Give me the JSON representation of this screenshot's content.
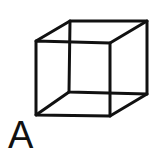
{
  "figure": {
    "label": "A",
    "stroke_color": "#111111",
    "background": "#ffffff",
    "front_face": [
      [
        36,
        41
      ],
      [
        110,
        43
      ],
      [
        110,
        116
      ],
      [
        36,
        115
      ]
    ],
    "back_face": [
      [
        70,
        21
      ],
      [
        147,
        21
      ],
      [
        147,
        94
      ],
      [
        69,
        92
      ]
    ]
  }
}
